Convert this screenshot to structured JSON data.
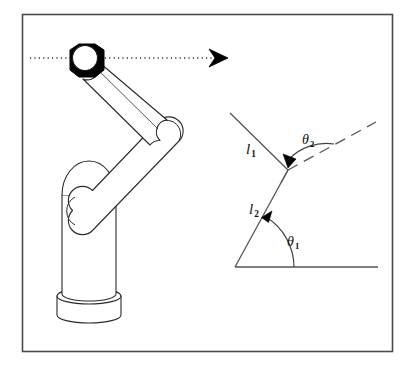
{
  "figure": {
    "background_color": "#ffffff",
    "frame": {
      "name": "outer-frame",
      "stroke_color": "#4a4a4a",
      "x": 22,
      "y": 14,
      "width": 371,
      "height": 338
    },
    "robot": {
      "name": "articulated-robot-arm",
      "stroke_color": "#2a2a2a",
      "fill_color": "#ffffff",
      "gripper_color": "#000000",
      "parts": [
        "gripper-end-effector",
        "forearm-link",
        "elbow-joint",
        "upper-arm-link",
        "shoulder-joint",
        "base-column",
        "base-disc"
      ]
    },
    "trajectory": {
      "name": "horizontal-dotted-trajectory",
      "style": "dotted",
      "color": "#333333",
      "arrow": "right-arrowhead",
      "y": 58,
      "x_start": 30,
      "x_end": 228
    },
    "angle_diagram": {
      "name": "kinematic-angle-diagram",
      "stroke_color": "#555555",
      "origin": {
        "x": 235,
        "y": 267
      },
      "elbow": {
        "x": 288,
        "y": 170
      },
      "tip": {
        "x": 230,
        "y": 113
      },
      "baseline_end": {
        "x": 378,
        "y": 267
      },
      "dashed_extension_end": {
        "x": 376,
        "y": 122
      },
      "labels": {
        "link1": {
          "symbol": "l",
          "subscript": "1"
        },
        "link2": {
          "symbol": "l",
          "subscript": "2"
        },
        "angle1": {
          "symbol": "θ",
          "subscript": "1"
        },
        "angle2": {
          "symbol": "θ",
          "subscript": "2"
        }
      }
    }
  }
}
